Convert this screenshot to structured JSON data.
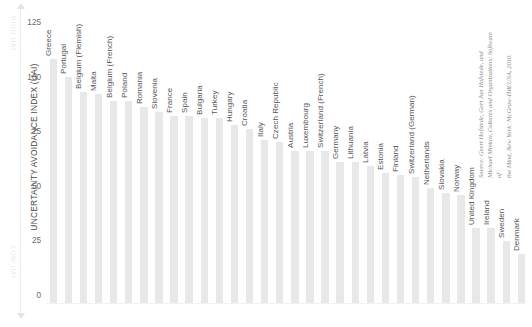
{
  "axis": {
    "y_title": "UNCERTAINTY AVOIDANCE INDEX (UAI)",
    "high_note": "HIGH UAI",
    "low_note": "LOW UAI"
  },
  "source": {
    "line1": "Source: Geert Hofstede, Gert Jan Hofstede, and Michael Minkov, Cultures and Organizations: Software of",
    "line2": "the Mind, New York: McGraw-Hill/USA, 2010."
  },
  "chart_data": {
    "type": "bar",
    "title": "",
    "xlabel": "",
    "ylabel": "UNCERTAINTY AVOIDANCE INDEX (UAI)",
    "ylim": [
      0,
      130
    ],
    "yticks": [
      0,
      25,
      50,
      75,
      100,
      125
    ],
    "grid": false,
    "legend": null,
    "orientation": "vertical",
    "bar_color": "#e8e8e8",
    "categories": [
      "Greece",
      "Portugal",
      "Belgium (Flemish)",
      "Malta",
      "Belgium (French)",
      "Poland",
      "Romania",
      "Slovenia",
      "France",
      "Spain",
      "Bulgaria",
      "Turkey",
      "Hungary",
      "Croatia",
      "Italy",
      "Czech Republic",
      "Austria",
      "Luxembourg",
      "Switzerland (French)",
      "Germany",
      "Lithuania",
      "Latvia",
      "Estonia",
      "Finland",
      "Switzerland (German)",
      "Netherlands",
      "Slovakia",
      "Norway",
      "United Kingdom",
      "Ireland",
      "Sweden",
      "Denmark"
    ],
    "values": [
      112,
      104,
      97,
      96,
      93,
      93,
      90,
      88,
      86,
      86,
      85,
      85,
      82,
      80,
      75,
      74,
      70,
      70,
      70,
      65,
      65,
      63,
      60,
      59,
      58,
      53,
      51,
      50,
      35,
      35,
      29,
      23
    ]
  }
}
